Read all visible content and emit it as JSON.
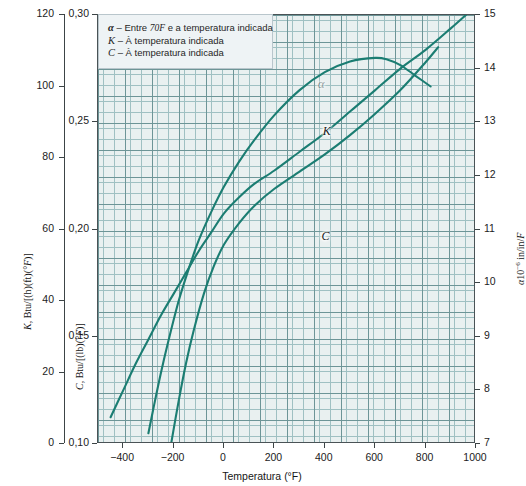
{
  "chart_data": {
    "type": "line",
    "title": "",
    "xlabel": "Temperatura (°F)",
    "xlim": [
      -500,
      1000
    ],
    "x_ticks": [
      -400,
      -200,
      0,
      200,
      400,
      600,
      800,
      1000
    ],
    "x_ticklabels": [
      "−400",
      "−200",
      "0",
      "200",
      "400",
      "600",
      "800",
      "1000"
    ],
    "axes": [
      {
        "id": "left-outer",
        "name": "K",
        "label": "K, Btu/[(h)(ft)(°F)]",
        "label_symbol": "K",
        "label_unit": ", Btu/[(h)(ft)(°F)]",
        "side": "left",
        "lim": [
          0,
          120
        ],
        "ticks": [
          0,
          20,
          40,
          60,
          80,
          100,
          120
        ],
        "ticklabels": [
          "0",
          "20",
          "40",
          "60",
          "80",
          "100",
          "120"
        ]
      },
      {
        "id": "left-inner",
        "name": "C",
        "label": "C, Btu/[(lb)(°F)]",
        "label_symbol": "C",
        "label_unit": ", Btu/[(lb)(°F)]",
        "side": "left",
        "lim": [
          0.1,
          0.3
        ],
        "ticks": [
          0.1,
          0.15,
          0.2,
          0.25,
          0.3
        ],
        "ticklabels": [
          "0,10",
          "0,15",
          "0,20",
          "0,25",
          "0,30"
        ]
      },
      {
        "id": "right",
        "name": "alpha",
        "label": "α10⁻⁶ in/in/F",
        "label_symbol": "α",
        "label_mantissa": "10",
        "label_exponent": "−6",
        "label_unit": " in/in/F",
        "side": "right",
        "lim": [
          7,
          15
        ],
        "ticks": [
          7,
          8,
          9,
          10,
          11,
          12,
          13,
          14,
          15
        ],
        "ticklabels": [
          "7",
          "8",
          "9",
          "10",
          "11",
          "12",
          "13",
          "14",
          "15"
        ]
      }
    ],
    "grid": true,
    "grid_minor": true,
    "legend_position": "top-left",
    "series": [
      {
        "name": "alpha",
        "label": "α",
        "axis": "right",
        "color": "#1b7d72",
        "points": [
          [
            -450,
            7.5
          ],
          [
            -400,
            8.0
          ],
          [
            -350,
            8.5
          ],
          [
            -300,
            8.95
          ],
          [
            -250,
            9.4
          ],
          [
            -200,
            9.8
          ],
          [
            -150,
            10.2
          ],
          [
            -100,
            10.6
          ],
          [
            -50,
            10.95
          ],
          [
            0,
            11.3
          ],
          [
            60,
            11.6
          ],
          [
            120,
            11.85
          ],
          [
            200,
            12.1
          ],
          [
            300,
            12.45
          ],
          [
            400,
            12.8
          ],
          [
            500,
            13.2
          ],
          [
            600,
            13.6
          ],
          [
            700,
            14.0
          ],
          [
            800,
            14.35
          ],
          [
            900,
            14.75
          ],
          [
            960,
            15.0
          ]
        ]
      },
      {
        "name": "K",
        "label": "K",
        "axis": "left-outer",
        "color": "#1b7d72",
        "points": [
          [
            -300,
            3
          ],
          [
            -280,
            10
          ],
          [
            -250,
            20
          ],
          [
            -220,
            29
          ],
          [
            -180,
            40
          ],
          [
            -140,
            49
          ],
          [
            -100,
            57
          ],
          [
            -50,
            65
          ],
          [
            0,
            72
          ],
          [
            60,
            79
          ],
          [
            120,
            85
          ],
          [
            200,
            92
          ],
          [
            300,
            99
          ],
          [
            400,
            104
          ],
          [
            500,
            107
          ],
          [
            600,
            108
          ],
          [
            650,
            107.5
          ],
          [
            700,
            106
          ],
          [
            760,
            103
          ],
          [
            820,
            100
          ]
        ]
      },
      {
        "name": "C",
        "label": "C",
        "axis": "left-inner",
        "color": "#1b7d72",
        "points": [
          [
            -210,
            0.1
          ],
          [
            -180,
            0.12
          ],
          [
            -150,
            0.138
          ],
          [
            -120,
            0.153
          ],
          [
            -80,
            0.17
          ],
          [
            -40,
            0.183
          ],
          [
            0,
            0.193
          ],
          [
            60,
            0.203
          ],
          [
            120,
            0.211
          ],
          [
            200,
            0.219
          ],
          [
            300,
            0.227
          ],
          [
            400,
            0.235
          ],
          [
            500,
            0.244
          ],
          [
            600,
            0.254
          ],
          [
            700,
            0.265
          ],
          [
            800,
            0.278
          ],
          [
            850,
            0.285
          ]
        ]
      }
    ],
    "annotations": [
      {
        "name": "alpha-curve-label",
        "text": "α",
        "x": 400,
        "y_axis": "right",
        "y": 13.7
      },
      {
        "name": "K-curve-label",
        "text": "K",
        "x": 420,
        "y_axis": "left-outer",
        "y": 87
      },
      {
        "name": "C-curve-label",
        "text": "C",
        "x": 415,
        "y_axis": "left-inner",
        "y": 0.196
      }
    ]
  },
  "legend": {
    "name": "legend-box",
    "rows": [
      {
        "symbol": "α",
        "dash": " – ",
        "text": "Entre ",
        "italic": "70F",
        "text2": " e a temperatura indicada"
      },
      {
        "symbol": "K",
        "dash": " – ",
        "text": "À temperatura indicada",
        "italic": "",
        "text2": ""
      },
      {
        "symbol": "C",
        "dash": " – ",
        "text": "À temperatura indicada",
        "italic": "",
        "text2": ""
      }
    ]
  },
  "axis_titles": {
    "x": "Temperatura (°F)",
    "x_unit_italic": "F",
    "k": "K, Btu/[(h)(ft)(°F)]",
    "k_symbol": "K",
    "k_rest": ", Btu/[(h)(ft)(",
    "k_deg": "°F",
    "k_tail": ")]",
    "c_symbol": "C",
    "c_rest": ", Btu/[(lb)(",
    "c_deg": "°F",
    "c_tail": ")]",
    "alpha_symbol": "α",
    "alpha_base": "10",
    "alpha_exp": "−6",
    "alpha_tail": " in/in/",
    "alpha_F": "F"
  },
  "ticks": {
    "x": [
      "−400",
      "−200",
      "0",
      "200",
      "400",
      "600",
      "800",
      "1000"
    ],
    "k": [
      "120",
      "100",
      "80",
      "60",
      "40",
      "20",
      "0"
    ],
    "c": [
      "0,30",
      "0,25",
      "0,20",
      "0,15",
      "0,10"
    ],
    "alpha": [
      "15",
      "14",
      "13",
      "12",
      "11",
      "10",
      "9",
      "8",
      "7"
    ]
  },
  "curve_labels": {
    "alpha": "α",
    "k": "K",
    "c": "C"
  },
  "colors": {
    "curve": "#1b7d72",
    "plot_bg": "#e9f0f0",
    "grid_minor": "#9fc0c2",
    "grid_major": "#6d9597",
    "frame": "#4a5356",
    "legend_bg": "#eef3f5",
    "legend_border": "#b9c6cc",
    "text": "#1c1c1c"
  }
}
